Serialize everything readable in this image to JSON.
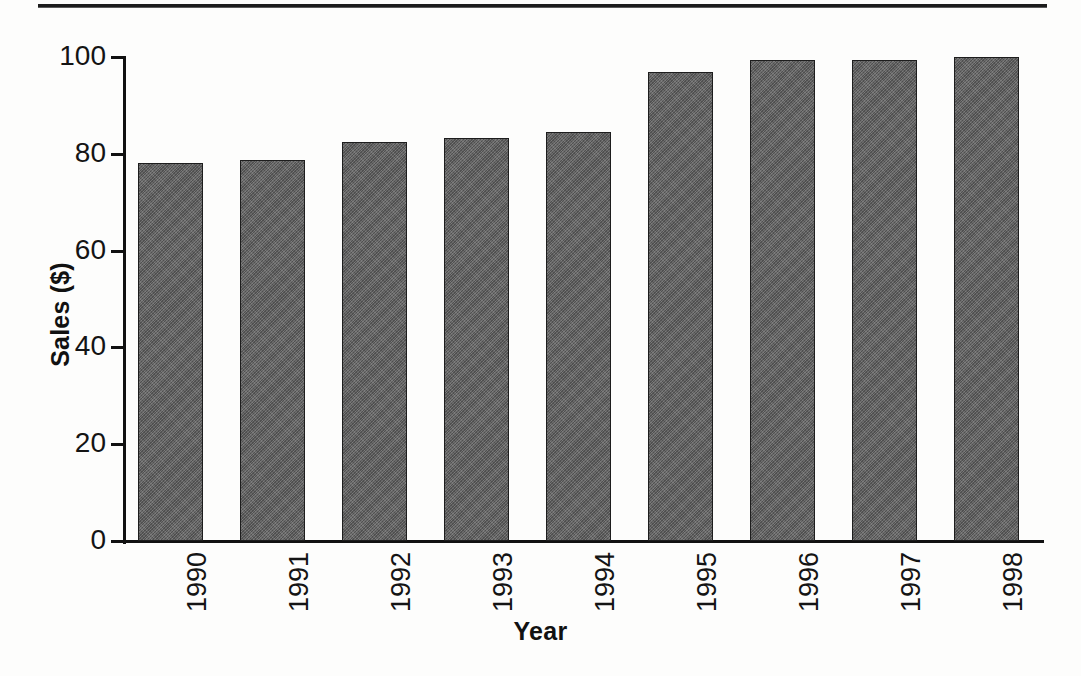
{
  "page": {
    "top_rule": "horizontal-rule",
    "background_color": "#fdfdfc"
  },
  "chart_data": {
    "type": "bar",
    "title": "",
    "subtitle": "",
    "categories": [
      "1990",
      "1991",
      "1992",
      "1993",
      "1994",
      "1995",
      "1996",
      "1997",
      "1998"
    ],
    "values": [
      78,
      78.7,
      82.4,
      83.3,
      84.5,
      96.9,
      99.4,
      99.4,
      100
    ],
    "xlabel": "Year",
    "ylabel": "Sales ($)",
    "ylim": [
      0,
      100
    ],
    "yticks": [
      0,
      20,
      40,
      60,
      80,
      100
    ],
    "ytick_labels": [
      "0",
      "20",
      "40",
      "60",
      "80",
      "100"
    ],
    "grid": false,
    "legend": null,
    "legend_position": "none",
    "bar_color": "#5f5f5f",
    "bar_edge_color": "#1d1d1d",
    "axis_color": "#111111",
    "text_color": "#141414",
    "xtick_rotation": 90,
    "series": [
      {
        "name": "Sales",
        "values": [
          78,
          78.7,
          82.4,
          83.3,
          84.5,
          96.9,
          99.4,
          99.4,
          100
        ]
      }
    ],
    "annotations": []
  }
}
